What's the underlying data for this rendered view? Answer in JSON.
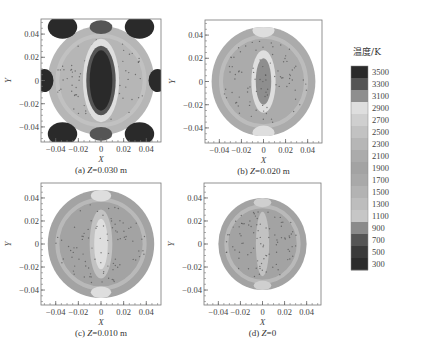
{
  "chart_data": {
    "type": "heatmap",
    "title": "",
    "legend": {
      "title": "温度/K",
      "placement": "right",
      "levels": [
        3500,
        3300,
        3100,
        2900,
        2700,
        2500,
        2300,
        2100,
        1900,
        1700,
        1500,
        1300,
        1100,
        900,
        700,
        500,
        300
      ],
      "colors": [
        "#2a2a2a",
        "#555555",
        "#8e8e8e",
        "#dedede",
        "#cfcfcf",
        "#c2c2c2",
        "#b6b6b6",
        "#ababab",
        "#a3a3a3",
        "#a9a9a9",
        "#b3b3b3",
        "#bdbdbd",
        "#c6c6c6",
        "#8a8a8a",
        "#555555",
        "#3a3a3a",
        "#2b2b2b"
      ]
    },
    "panels": [
      {
        "id": "a",
        "caption_prefix": "(a) ",
        "caption_var": "Z",
        "caption_value": "=0.030 m",
        "xlabel": "X",
        "ylabel": "Y",
        "xlim": [
          -0.053,
          0.053
        ],
        "ylim": [
          -0.053,
          0.053
        ],
        "xticks": [
          "-0.04",
          "-0.02",
          "0",
          "0.02",
          "0.04"
        ],
        "yticks": [
          "0.04",
          "0.02",
          "0",
          "-0.02",
          "-0.04"
        ],
        "domain_radius": 0.047,
        "background_temp": 2300,
        "features": [
          {
            "shape": "ellipse",
            "cx": 0,
            "cy": 0,
            "rx": 0.016,
            "ry": 0.036,
            "temp": 2900
          },
          {
            "shape": "ellipse",
            "cx": 0,
            "cy": 0,
            "rx": 0.013,
            "ry": 0.03,
            "temp": 3300
          },
          {
            "shape": "ellipse",
            "cx": 0,
            "cy": 0,
            "rx": 0.01,
            "ry": 0.026,
            "temp": 3500
          },
          {
            "shape": "ellipse",
            "cx": -0.034,
            "cy": 0.046,
            "rx": 0.013,
            "ry": 0.01,
            "temp": 3500
          },
          {
            "shape": "ellipse",
            "cx": 0.034,
            "cy": 0.046,
            "rx": 0.013,
            "ry": 0.01,
            "temp": 3500
          },
          {
            "shape": "ellipse",
            "cx": -0.034,
            "cy": -0.046,
            "rx": 0.013,
            "ry": 0.01,
            "temp": 3500
          },
          {
            "shape": "ellipse",
            "cx": 0.034,
            "cy": -0.046,
            "rx": 0.013,
            "ry": 0.01,
            "temp": 3500
          },
          {
            "shape": "ellipse",
            "cx": -0.05,
            "cy": 0,
            "rx": 0.008,
            "ry": 0.01,
            "temp": 3500
          },
          {
            "shape": "ellipse",
            "cx": 0.05,
            "cy": 0,
            "rx": 0.008,
            "ry": 0.01,
            "temp": 3500
          },
          {
            "shape": "ellipse",
            "cx": 0,
            "cy": 0.046,
            "rx": 0.01,
            "ry": 0.006,
            "temp": 3300
          },
          {
            "shape": "ellipse",
            "cx": 0,
            "cy": -0.046,
            "rx": 0.01,
            "ry": 0.006,
            "temp": 3300
          }
        ]
      },
      {
        "id": "b",
        "caption_prefix": "(b) ",
        "caption_var": "Z",
        "caption_value": "=0.020 m",
        "xlabel": "X",
        "ylabel": "Y",
        "xlim": [
          -0.053,
          0.053
        ],
        "ylim": [
          -0.053,
          0.053
        ],
        "xticks": [
          "-0.04",
          "-0.02",
          "0",
          "0.02",
          "0.04"
        ],
        "yticks": [
          "0.04",
          "0.02",
          "0",
          "-0.02",
          "-0.04"
        ],
        "domain_radius": 0.047,
        "background_temp": 2100,
        "features": [
          {
            "shape": "ellipse",
            "cx": 0,
            "cy": 0,
            "rx": 0.011,
            "ry": 0.027,
            "temp": 2900
          },
          {
            "shape": "ellipse",
            "cx": 0,
            "cy": 0,
            "rx": 0.007,
            "ry": 0.02,
            "temp": 3100
          },
          {
            "shape": "ellipse",
            "cx": 0,
            "cy": 0.044,
            "rx": 0.01,
            "ry": 0.006,
            "temp": 2900
          },
          {
            "shape": "ellipse",
            "cx": 0,
            "cy": -0.044,
            "rx": 0.01,
            "ry": 0.006,
            "temp": 2900
          }
        ]
      },
      {
        "id": "c",
        "caption_prefix": "(c) ",
        "caption_var": "Z",
        "caption_value": "=0.010 m",
        "xlabel": "X",
        "ylabel": "Y",
        "xlim": [
          -0.053,
          0.053
        ],
        "ylim": [
          -0.053,
          0.053
        ],
        "xticks": [
          "-0.04",
          "-0.02",
          "0",
          "0.02",
          "0.04"
        ],
        "yticks": [
          "0.04",
          "0.02",
          "0",
          "-0.02",
          "-0.04"
        ],
        "domain_radius": 0.047,
        "background_temp": 1900,
        "features": [
          {
            "shape": "ellipse",
            "cx": 0,
            "cy": 0,
            "rx": 0.01,
            "ry": 0.03,
            "temp": 2500
          },
          {
            "shape": "ellipse",
            "cx": 0,
            "cy": 0,
            "rx": 0.006,
            "ry": 0.022,
            "temp": 2900
          },
          {
            "shape": "ellipse",
            "cx": 0,
            "cy": 0.042,
            "rx": 0.009,
            "ry": 0.005,
            "temp": 2900
          },
          {
            "shape": "ellipse",
            "cx": 0,
            "cy": -0.042,
            "rx": 0.009,
            "ry": 0.005,
            "temp": 2900
          }
        ]
      },
      {
        "id": "d",
        "caption_prefix": "(d) ",
        "caption_var": "Z",
        "caption_value": "=0",
        "xlabel": "X",
        "ylabel": "Y",
        "xlim": [
          -0.053,
          0.053
        ],
        "ylim": [
          -0.053,
          0.053
        ],
        "xticks": [
          "-0.04",
          "-0.02",
          "0",
          "0.02",
          "0.04"
        ],
        "yticks": [
          "0.04",
          "0.02",
          "0",
          "-0.02",
          "-0.04"
        ],
        "domain_radius": 0.04,
        "background_temp": 1900,
        "features": [
          {
            "shape": "ellipse",
            "cx": 0,
            "cy": 0,
            "rx": 0.006,
            "ry": 0.028,
            "temp": 2500
          },
          {
            "shape": "ellipse",
            "cx": 0,
            "cy": 0.036,
            "rx": 0.008,
            "ry": 0.004,
            "temp": 2700
          },
          {
            "shape": "ellipse",
            "cx": 0,
            "cy": -0.036,
            "rx": 0.008,
            "ry": 0.004,
            "temp": 2700
          }
        ]
      }
    ]
  }
}
